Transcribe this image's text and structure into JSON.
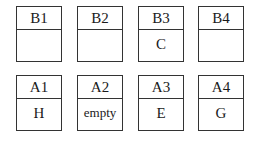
{
  "rows": {
    "top": [
      {
        "label": "B1",
        "content": ""
      },
      {
        "label": "B2",
        "content": ""
      },
      {
        "label": "B3",
        "content": "C"
      },
      {
        "label": "B4",
        "content": ""
      }
    ],
    "bottom": [
      {
        "label": "A1",
        "content": "H"
      },
      {
        "label": "A2",
        "content": "empty"
      },
      {
        "label": "A3",
        "content": "E"
      },
      {
        "label": "A4",
        "content": "G"
      }
    ]
  },
  "colors": {
    "border": "#333333",
    "text": "#1a1a1a",
    "background": "#ffffff"
  }
}
